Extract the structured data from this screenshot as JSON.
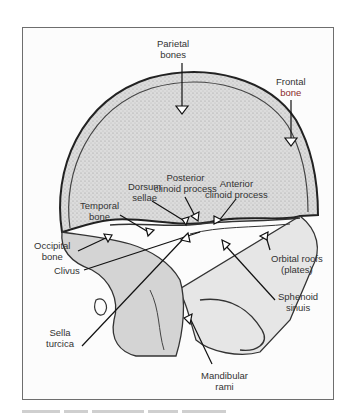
{
  "figure": {
    "type": "lateral skull radiograph (edge-enhanced)",
    "labels": {
      "parietal": [
        "Parietal",
        "bones"
      ],
      "frontal": [
        "Frontal",
        "bone"
      ],
      "posterior_clinoid": [
        "Posterior",
        "clinoid process"
      ],
      "dorsum": [
        "Dorsum",
        "sellae"
      ],
      "anterior_clinoid": [
        "Anterior",
        "clinoid process"
      ],
      "temporal": [
        "Temporal",
        "bone"
      ],
      "occipital": [
        "Occipital",
        "bone"
      ],
      "clivus": [
        "Clivus"
      ],
      "orbital": [
        "Orbital roofs",
        "(plates)"
      ],
      "sphenoid": [
        "Sphenoid",
        "sinuis"
      ],
      "sella": [
        "Sella",
        "turcica"
      ],
      "mandibular": [
        "Mandibular",
        "rami"
      ]
    },
    "caption": "illegible figure caption"
  }
}
